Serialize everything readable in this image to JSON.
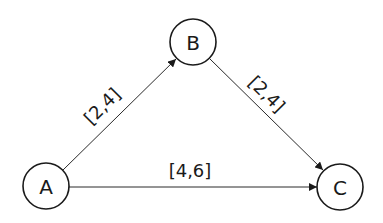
{
  "diagram": {
    "type": "directed-graph",
    "nodes": [
      {
        "id": "A",
        "label": "A",
        "cx": 46,
        "cy": 186,
        "r": 23
      },
      {
        "id": "B",
        "label": "B",
        "cx": 193,
        "cy": 42,
        "r": 23
      },
      {
        "id": "C",
        "label": "C",
        "cx": 340,
        "cy": 187,
        "r": 23
      }
    ],
    "edges": [
      {
        "from": "A",
        "to": "B",
        "label": "[2,4]"
      },
      {
        "from": "B",
        "to": "C",
        "label": "[2,4]"
      },
      {
        "from": "A",
        "to": "C",
        "label": "[4,6]"
      }
    ]
  }
}
